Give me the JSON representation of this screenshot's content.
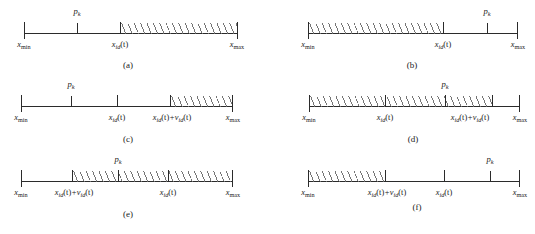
{
  "figure": {
    "symbols": {
      "x_min": "x",
      "x_min_sub": "min",
      "x_max": "x",
      "x_max_sub": "max",
      "p_k": "p",
      "p_k_sub": "k",
      "x_id_t": "x",
      "x_id_sub": "id",
      "t_paren": "(t)",
      "plus": "+",
      "v_id_t": "v",
      "v_id_sub": "id"
    },
    "panels": [
      {
        "id": "a",
        "caption": "(a)",
        "labels": {
          "left": "xmin",
          "left_text": "x",
          "left_sub": "min",
          "right_text": "x",
          "right_sub": "max",
          "pk_text": "p",
          "pk_sub": "k",
          "mid_text": "x",
          "mid_sub": "id",
          "mid_suffix": "(t)"
        },
        "hatch_desc": "shaded from x_id(t) to x_max"
      },
      {
        "id": "b",
        "caption": "(b)",
        "hatch_desc": "shaded from x_min to x_id(t)"
      },
      {
        "id": "c",
        "caption": "(c)",
        "hatch_desc": "shaded from x_id(t)+v_id(t) to x_max"
      },
      {
        "id": "d",
        "caption": "(d)",
        "hatch_desc": "shaded from x_min past x_id(t)+v_id(t)"
      },
      {
        "id": "e",
        "caption": "(e)",
        "hatch_desc": "shaded from x_id(t)+v_id(t) to x_max"
      },
      {
        "id": "f",
        "caption": "(f)",
        "hatch_desc": "shaded from x_min to x_id(t)+v_id(t)"
      }
    ]
  },
  "labels": {
    "xmin": {
      "base": "x",
      "sub": "min"
    },
    "xmax": {
      "base": "x",
      "sub": "max"
    },
    "pk": {
      "base": "p",
      "sub": "k"
    },
    "xid": {
      "base": "x",
      "sub": "id",
      "suffix": "(t)"
    },
    "vid": {
      "base": "v",
      "sub": "id",
      "suffix": "(t)"
    },
    "plus": "+"
  },
  "captions": {
    "a": "(a)",
    "b": "(b)",
    "c": "(c)",
    "d": "(d)",
    "e": "(e)",
    "f": "(f)"
  },
  "colors": {
    "line": "#2b2b2b",
    "hatch": "#6e6e6e",
    "background": "#ffffff",
    "text": "#1a1a1a"
  }
}
